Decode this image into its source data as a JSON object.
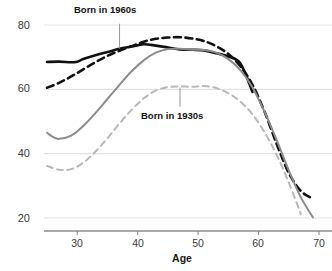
{
  "chart_data": {
    "type": "line",
    "title": "",
    "subtitle": "",
    "xlabel": "Age",
    "ylabel": "",
    "xlim": [
      25,
      70
    ],
    "ylim": [
      18,
      82
    ],
    "grid": "horizontal",
    "legend": "inline-annotations",
    "x_ticks": [
      30,
      40,
      50,
      60,
      70
    ],
    "y_ticks": [
      20,
      40,
      60,
      80
    ],
    "annotations": [
      {
        "text": "Born in 1960s",
        "x": 37,
        "y": 81,
        "leader_to_x": 37,
        "leader_to_y": 72.6
      },
      {
        "text": "Born in 1930s",
        "x": 47,
        "y": 54,
        "leader_to_x": 47,
        "leader_to_y": 60.6
      }
    ],
    "series": [
      {
        "name": "Born in 1960s - solid",
        "color": "#111111",
        "style": "solid",
        "x": [
          25,
          27,
          29,
          30,
          31,
          33,
          35,
          37,
          39,
          41,
          43,
          45,
          47,
          49,
          51,
          53,
          55,
          57,
          59
        ],
        "values": [
          68.5,
          68.6,
          68.4,
          68.6,
          69.4,
          70.6,
          71.6,
          72.6,
          73.3,
          74.0,
          73.6,
          73.0,
          72.4,
          72.3,
          72.1,
          71.2,
          70.2,
          68.0,
          59.2
        ]
      },
      {
        "name": "Born in 1960s - dashed",
        "color": "#111111",
        "style": "dashed",
        "x": [
          25,
          27,
          29,
          31,
          33,
          35,
          37,
          39,
          41,
          43,
          45,
          47,
          49,
          51,
          53,
          55,
          57,
          59,
          61,
          63,
          65,
          67,
          69
        ],
        "values": [
          60.5,
          62.0,
          64.0,
          66.2,
          68.4,
          70.4,
          72.0,
          73.4,
          74.8,
          75.7,
          76.1,
          76.2,
          75.8,
          75.0,
          73.4,
          71.0,
          67.2,
          61.4,
          53.0,
          43.0,
          34.0,
          28.4,
          26.0
        ]
      },
      {
        "name": "Born in 1930s - solid",
        "color": "#8c8c8c",
        "style": "solid",
        "x": [
          25,
          26,
          27,
          29,
          31,
          33,
          35,
          37,
          39,
          41,
          43,
          45,
          47,
          49,
          51,
          53,
          55,
          57,
          59,
          61,
          63,
          65,
          67,
          69
        ],
        "values": [
          46.5,
          45.2,
          44.6,
          45.6,
          48.6,
          52.6,
          57.0,
          61.4,
          65.6,
          69.0,
          71.4,
          72.5,
          72.6,
          72.3,
          72.2,
          71.4,
          69.4,
          66.0,
          60.6,
          53.0,
          44.2,
          34.8,
          26.4,
          20.2
        ]
      },
      {
        "name": "Born in 1930s - dashed",
        "color": "#b8b8b8",
        "style": "dashed",
        "x": [
          25,
          27,
          29,
          31,
          33,
          35,
          37,
          39,
          41,
          43,
          45,
          47,
          49,
          51,
          53,
          55,
          57,
          59,
          61,
          63,
          65,
          67
        ],
        "values": [
          36.2,
          35.0,
          35.2,
          37.2,
          40.6,
          44.8,
          49.4,
          53.6,
          57.2,
          59.6,
          60.7,
          60.9,
          60.8,
          61.0,
          60.4,
          58.8,
          56.2,
          52.2,
          46.6,
          39.6,
          31.0,
          21.2
        ]
      }
    ]
  },
  "axis": {
    "x_title": "Age",
    "y_tick_labels": [
      "80",
      "60",
      "40",
      "20"
    ],
    "x_tick_labels": [
      "30",
      "40",
      "50",
      "60",
      "70"
    ]
  },
  "annotations": {
    "cohort_1960s": "Born in 1960s",
    "cohort_1930s": "Born in 1930s"
  },
  "colors": {
    "black_series": "#111111",
    "gray_series_solid": "#8c8c8c",
    "gray_series_dashed": "#b8b8b8",
    "gridline": "#e3e3e3",
    "axis_line": "#808080",
    "tick_text": "#3a3a3a"
  }
}
